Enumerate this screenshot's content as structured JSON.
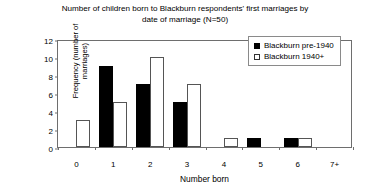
{
  "chart_data": {
    "type": "bar",
    "title": "Number of children born to Blackburn respondents' first marriages by date of marriage (N=50)",
    "title_lines": [
      "Number of children born to Blackburn respondents' first marriages by",
      "date of marriage (N=50)"
    ],
    "xlabel": "Number born",
    "ylabel": "Frequency (number of marriages)",
    "ylabel_lines": [
      "Frequency (number of",
      "marriages)"
    ],
    "categories": [
      "0",
      "1",
      "2",
      "3",
      "4",
      "5",
      "6",
      "7+"
    ],
    "ylim": [
      0,
      12
    ],
    "yticks": [
      "0",
      "2",
      "4",
      "6",
      "8",
      "10",
      "12"
    ],
    "ytick_values": [
      0,
      2,
      4,
      6,
      8,
      10,
      12
    ],
    "grid": false,
    "legend_position": "top-right",
    "series": [
      {
        "name": "Blackburn pre-1940",
        "values": [
          0,
          9,
          7,
          5,
          0,
          1,
          1,
          0
        ],
        "color": "#000000",
        "style": "filled"
      },
      {
        "name": "Blackburn 1940+",
        "values": [
          3,
          5,
          10,
          7,
          1,
          0,
          1,
          0
        ],
        "color": "#ffffff",
        "style": "outlined"
      }
    ]
  }
}
